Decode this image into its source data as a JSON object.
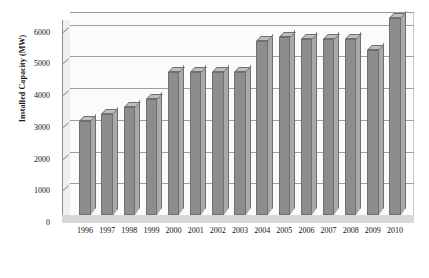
{
  "chart_data": {
    "type": "bar",
    "title": "",
    "subtitle": "",
    "xlabel": "",
    "ylabel": "Installed Capacity (MW)",
    "categories": [
      "1996",
      "1997",
      "1998",
      "1999",
      "2000",
      "2001",
      "2002",
      "2003",
      "2004",
      "2005",
      "2006",
      "2007",
      "2008",
      "2009",
      "2010"
    ],
    "values": [
      2950,
      3200,
      3400,
      3650,
      4500,
      4500,
      4500,
      4500,
      5500,
      5600,
      5550,
      5550,
      5550,
      5200,
      6200
    ],
    "series": [
      {
        "name": "Installed Capacity",
        "values": [
          2950,
          3200,
          3400,
          3650,
          4500,
          4500,
          4500,
          4500,
          5500,
          5600,
          5550,
          5550,
          5550,
          5200,
          6200
        ]
      }
    ],
    "ylim": [
      0,
      6400
    ],
    "yticks": [
      0,
      1000,
      2000,
      3000,
      4000,
      5000,
      6000
    ],
    "ytick_labels": [
      "0",
      "1000",
      "2000",
      "3000",
      "4000",
      "5000",
      "6000"
    ],
    "grid": true,
    "grid_axis": "y",
    "legend": false,
    "legend_position": "none",
    "style": "3d-column",
    "bar_color": "#8d8d8d",
    "bar_top_color": "#bdbdbd",
    "bar_side_color": "#a9a9a9",
    "bar_edge_color": "#6f6f6f",
    "grid_color": "#9e9e9e",
    "plot_background": "#fbfbfb",
    "floor_color": "#d8d8d8",
    "text_color": "#111111"
  }
}
